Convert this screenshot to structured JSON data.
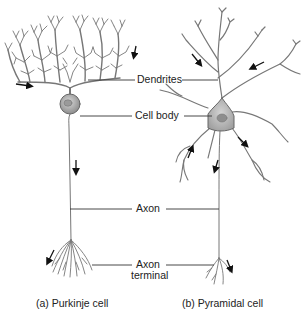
{
  "diagram": {
    "type": "neuron-comparison",
    "labels": {
      "dendrites": "Dendrites",
      "cell_body": "Cell body",
      "axon": "Axon",
      "axon_terminal_line1": "Axon",
      "axon_terminal_line2": "terminal"
    },
    "captions": {
      "left": "(a) Purkinje cell",
      "right": "(b) Pyramidal cell"
    },
    "colors": {
      "stroke": "#6a6a6a",
      "soma_fill": "#b8b8b8",
      "text": "#222222",
      "arrow": "#111111"
    }
  }
}
